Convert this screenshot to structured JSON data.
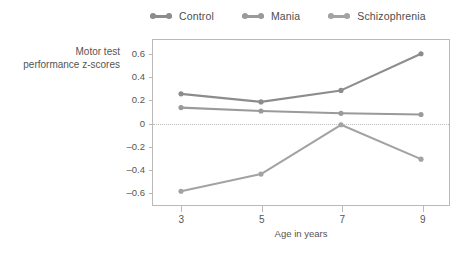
{
  "chart_data": {
    "type": "line",
    "title": "",
    "xlabel": "Age in years",
    "ylabel": "Motor test performance z-scores",
    "x": [
      3,
      5,
      7,
      9
    ],
    "xtick_labels": [
      "3",
      "5",
      "7",
      "9"
    ],
    "ytick_labels": [
      "0.6",
      "0.4",
      "0.2",
      "0",
      "–0.2",
      "–0.4",
      "–0.6"
    ],
    "ytick_values": [
      0.6,
      0.4,
      0.2,
      0,
      -0.2,
      -0.4,
      -0.6
    ],
    "ylim": [
      -0.72,
      0.72
    ],
    "xlim": [
      2.3,
      9.7
    ],
    "grid": false,
    "zero_reference_line": true,
    "legend_position": "top",
    "series": [
      {
        "name": "Control",
        "values": [
          0.25,
          0.18,
          0.28,
          0.6
        ],
        "color": "#8c8c8c"
      },
      {
        "name": "Mania",
        "values": [
          0.13,
          0.1,
          0.08,
          0.07
        ],
        "color": "#9a9a9a"
      },
      {
        "name": "Schizophrenia",
        "values": [
          -0.6,
          -0.45,
          -0.02,
          -0.32
        ],
        "color": "#a3a3a3"
      }
    ]
  },
  "ylabel_lines": {
    "line1": "Motor test",
    "line2": "performance z-scores"
  },
  "colors": {
    "axis": "#b9b9b9",
    "text": "#555555",
    "zero_line": "#bdbdbd",
    "background": "#ffffff"
  }
}
